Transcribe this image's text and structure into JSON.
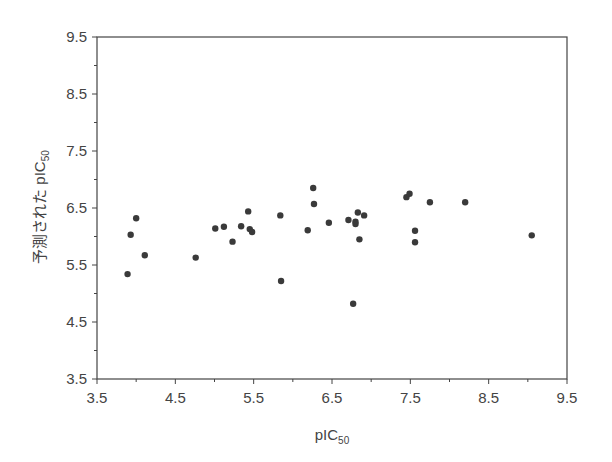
{
  "chart_data": {
    "type": "scatter",
    "title": "",
    "xlabel": "pIC",
    "xlabel_sub": "50",
    "ylabel": "予測された pIC",
    "ylabel_sub": "50",
    "xlim": [
      3.5,
      9.5
    ],
    "ylim": [
      3.5,
      9.5
    ],
    "xticks": [
      "3.5",
      "4.5",
      "5.5",
      "6.5",
      "7.5",
      "8.5",
      "9.5"
    ],
    "yticks": [
      "3.5",
      "4.5",
      "5.5",
      "6.5",
      "7.5",
      "8.5",
      "9.5"
    ],
    "grid": false,
    "legend": null,
    "marker_color": "#3a3a3a",
    "points": [
      {
        "x": 3.89,
        "y": 5.34
      },
      {
        "x": 3.93,
        "y": 6.03
      },
      {
        "x": 4.0,
        "y": 6.32
      },
      {
        "x": 4.11,
        "y": 5.67
      },
      {
        "x": 4.76,
        "y": 5.63
      },
      {
        "x": 5.01,
        "y": 6.14
      },
      {
        "x": 5.12,
        "y": 6.17
      },
      {
        "x": 5.23,
        "y": 5.91
      },
      {
        "x": 5.34,
        "y": 6.18
      },
      {
        "x": 5.43,
        "y": 6.44
      },
      {
        "x": 5.45,
        "y": 6.13
      },
      {
        "x": 5.48,
        "y": 6.08
      },
      {
        "x": 5.84,
        "y": 6.37
      },
      {
        "x": 5.85,
        "y": 5.22
      },
      {
        "x": 6.19,
        "y": 6.11
      },
      {
        "x": 6.26,
        "y": 6.85
      },
      {
        "x": 6.27,
        "y": 6.57
      },
      {
        "x": 6.46,
        "y": 6.24
      },
      {
        "x": 6.71,
        "y": 6.29
      },
      {
        "x": 6.77,
        "y": 4.82
      },
      {
        "x": 6.8,
        "y": 6.26
      },
      {
        "x": 6.8,
        "y": 6.22
      },
      {
        "x": 6.83,
        "y": 6.42
      },
      {
        "x": 6.85,
        "y": 5.95
      },
      {
        "x": 6.91,
        "y": 6.37
      },
      {
        "x": 7.45,
        "y": 6.69
      },
      {
        "x": 7.49,
        "y": 6.75
      },
      {
        "x": 7.56,
        "y": 6.1
      },
      {
        "x": 7.56,
        "y": 5.9
      },
      {
        "x": 7.75,
        "y": 6.6
      },
      {
        "x": 8.2,
        "y": 6.6
      },
      {
        "x": 9.05,
        "y": 6.02
      }
    ]
  }
}
